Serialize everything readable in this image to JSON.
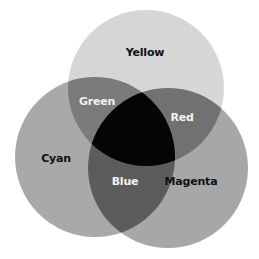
{
  "diagram": {
    "type": "venn",
    "title_fragment": "… y g …",
    "circles": [
      {
        "name": "Yellow",
        "cx": 146,
        "cy": 88,
        "r": 78,
        "fill": "#d6d6d6"
      },
      {
        "name": "Cyan",
        "cx": 95,
        "cy": 157,
        "r": 80,
        "fill": "#a9a9a9"
      },
      {
        "name": "Magenta",
        "cx": 168,
        "cy": 168,
        "r": 80,
        "fill": "#a7a7a7"
      }
    ],
    "regions": {
      "green_fill": "#7b7b7b",
      "red_fill": "#717171",
      "blue_fill": "#5c5c5c",
      "center_fill": "#050505"
    },
    "labels": [
      {
        "text": "Yellow",
        "x": 145,
        "y": 52,
        "color": "#111111"
      },
      {
        "text": "Green",
        "x": 97,
        "y": 101,
        "color": "#f2f2f2"
      },
      {
        "text": "Red",
        "x": 182,
        "y": 117,
        "color": "#f2f2f2"
      },
      {
        "text": "Cyan",
        "x": 56,
        "y": 158,
        "color": "#111111"
      },
      {
        "text": "Blue",
        "x": 125,
        "y": 181,
        "color": "#f2f2f2"
      },
      {
        "text": "Magenta",
        "x": 191,
        "y": 181,
        "color": "#111111"
      }
    ]
  }
}
